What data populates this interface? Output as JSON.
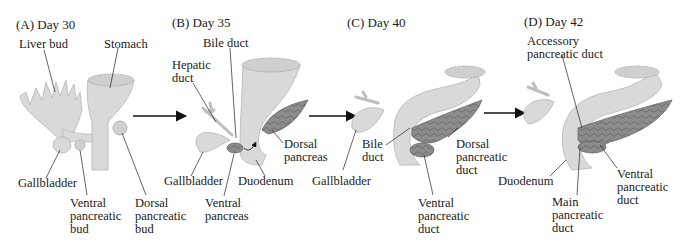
{
  "colors": {
    "tissue": "#d9d9d9",
    "tissue_edge": "#b5b5b5",
    "pancreas": "#8c8c8c",
    "pancreas_edge": "#5e5e5e",
    "line": "#222222",
    "arrow": "#111111"
  },
  "panels": [
    {
      "title": "(A)  Day 30",
      "labels": {
        "liver_bud": "Liver bud",
        "stomach": "Stomach",
        "gallbladder": "Gallbladder",
        "ventral_bud": [
          "Ventral",
          "pancreatic",
          "bud"
        ],
        "dorsal_bud": [
          "Dorsal",
          "pancreatic",
          "bud"
        ]
      }
    },
    {
      "title": "(B)  Day 35",
      "labels": {
        "bile_duct": "Bile duct",
        "hepatic_duct": [
          "Hepatic",
          "duct"
        ],
        "dorsal_pancreas": [
          "Dorsal",
          "pancreas"
        ],
        "gallbladder": "Gallbladder",
        "duodenum": "Duodenum",
        "ventral_pancreas": [
          "Ventral",
          "pancreas"
        ]
      }
    },
    {
      "title": "(C)  Day 40",
      "labels": {
        "bile_duct": [
          "Bile",
          "duct"
        ],
        "dorsal_pancreatic_duct": [
          "Dorsal",
          "pancreatic",
          "duct"
        ],
        "gallbladder": "Gallbladder",
        "ventral_pancreatic_duct": [
          "Ventral",
          "pancreatic",
          "duct"
        ]
      }
    },
    {
      "title": "(D)  Day 42",
      "labels": {
        "accessory_duct": [
          "Accessory",
          "pancreatic duct"
        ],
        "duodenum": "Duodenum",
        "ventral_pancreatic_duct": [
          "Ventral",
          "pancreatic",
          "duct"
        ],
        "main_pancreatic_duct": [
          "Main",
          "pancreatic",
          "duct"
        ]
      }
    }
  ]
}
